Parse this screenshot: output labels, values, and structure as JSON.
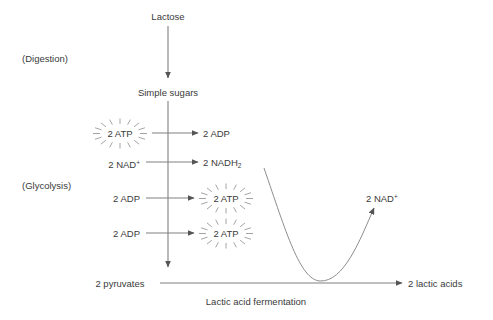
{
  "diagram": {
    "colors": {
      "line": "#808080",
      "text": "#3a3a3a",
      "background": "#ffffff",
      "burst": "#9a9a9a"
    },
    "stages": [
      {
        "id": "digestion",
        "label": "(Digestion)",
        "x": 22,
        "y": 53
      },
      {
        "id": "glycolysis",
        "label": "(Glycolysis)",
        "x": 22,
        "y": 180
      }
    ],
    "nodes": [
      {
        "id": "lactose",
        "label": "Lactose",
        "x": 168,
        "y": 11,
        "align": "center",
        "burst": false
      },
      {
        "id": "simple-sugars",
        "label": "Simple sugars",
        "x": 168,
        "y": 87,
        "align": "center",
        "burst": false
      },
      {
        "id": "atp-in",
        "label": "2 ATP",
        "x": 120,
        "y": 128,
        "align": "center",
        "burst": true
      },
      {
        "id": "adp-out",
        "label": "2 ADP",
        "x": 203,
        "y": 128,
        "align": "left",
        "burst": false
      },
      {
        "id": "nad-in",
        "label": "2 NAD",
        "sup": "+",
        "x": 140,
        "y": 157,
        "align": "right",
        "burst": false
      },
      {
        "id": "nadh2-out",
        "label": "2 NADH",
        "sub": "2",
        "x": 203,
        "y": 157,
        "align": "left",
        "burst": false
      },
      {
        "id": "adp-in-1",
        "label": "2 ADP",
        "x": 140,
        "y": 193,
        "align": "right",
        "burst": false
      },
      {
        "id": "atp-out-1",
        "label": "2 ATP",
        "x": 226,
        "y": 193,
        "align": "center",
        "burst": true
      },
      {
        "id": "adp-in-2",
        "label": "2 ADP",
        "x": 140,
        "y": 228,
        "align": "right",
        "burst": false
      },
      {
        "id": "atp-out-2",
        "label": "2 ATP",
        "x": 226,
        "y": 228,
        "align": "center",
        "burst": true
      },
      {
        "id": "pyruvates",
        "label": "2 pyruvates",
        "x": 120,
        "y": 278,
        "align": "center",
        "burst": false
      },
      {
        "id": "lactic-acids",
        "label": "2 lactic acids",
        "x": 408,
        "y": 278,
        "align": "left",
        "burst": false
      },
      {
        "id": "nad-regen",
        "label": "2 NAD",
        "sup": "+",
        "x": 366,
        "y": 191,
        "align": "left",
        "burst": false
      }
    ],
    "caption": {
      "label": "Lactic acid fermentation",
      "x": 256,
      "y": 296
    },
    "arrows": [
      {
        "id": "lactose-to-sugars",
        "type": "vertical",
        "x": 168,
        "y1": 26,
        "y2": 78
      },
      {
        "id": "glycolysis-main",
        "type": "vertical",
        "x": 168,
        "y1": 101,
        "y2": 267
      },
      {
        "id": "atp-to-adp",
        "type": "horizontal",
        "y": 133,
        "x1": 152,
        "x2": 198
      },
      {
        "id": "nad-to-nadh2",
        "type": "horizontal",
        "y": 162,
        "x1": 146,
        "x2": 198
      },
      {
        "id": "adp-to-atp-1",
        "type": "horizontal",
        "y": 198,
        "x1": 146,
        "x2": 194
      },
      {
        "id": "adp-to-atp-2",
        "type": "horizontal",
        "y": 233,
        "x1": 146,
        "x2": 194
      },
      {
        "id": "pyruvates-to-lactic",
        "type": "horizontal",
        "y": 283,
        "x1": 160,
        "x2": 402
      },
      {
        "id": "nadh2-to-nad-curve",
        "type": "curve",
        "path": "M 264 168 C 286 232 300 280 320 281 C 344 282 360 240 374 208"
      }
    ]
  }
}
